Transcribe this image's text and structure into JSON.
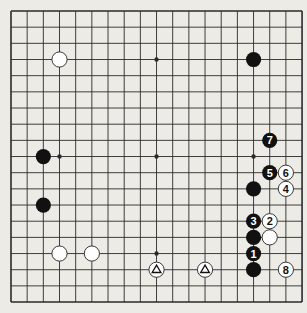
{
  "board": {
    "size": 19,
    "origin": [
      11,
      11
    ],
    "spacing": 16.17,
    "background": "#ecebe6",
    "line_color": "#2a2a2a",
    "black_color": "#111111",
    "white_color": "#ffffff"
  },
  "star_points": [
    {
      "col": 9,
      "row": 3
    },
    {
      "col": 3,
      "row": 9
    },
    {
      "col": 9,
      "row": 9
    },
    {
      "col": 15,
      "row": 9
    },
    {
      "col": 9,
      "row": 15
    }
  ],
  "stones": [
    {
      "color": "white",
      "col": 3,
      "row": 3,
      "label": "",
      "mark": ""
    },
    {
      "color": "black",
      "col": 15,
      "row": 3,
      "label": "",
      "mark": ""
    },
    {
      "color": "black",
      "col": 2,
      "row": 9,
      "label": "",
      "mark": ""
    },
    {
      "color": "black",
      "col": 2,
      "row": 12,
      "label": "",
      "mark": ""
    },
    {
      "color": "white",
      "col": 3,
      "row": 15,
      "label": "",
      "mark": ""
    },
    {
      "color": "white",
      "col": 5,
      "row": 15,
      "label": "",
      "mark": ""
    },
    {
      "color": "white",
      "col": 9,
      "row": 16,
      "label": "",
      "mark": "triangle"
    },
    {
      "color": "white",
      "col": 12,
      "row": 16,
      "label": "",
      "mark": "triangle"
    },
    {
      "color": "black",
      "col": 16,
      "row": 8,
      "label": "7",
      "mark": ""
    },
    {
      "color": "black",
      "col": 16,
      "row": 10,
      "label": "5",
      "mark": ""
    },
    {
      "color": "white",
      "col": 17,
      "row": 10,
      "label": "6",
      "mark": ""
    },
    {
      "color": "black",
      "col": 15,
      "row": 11,
      "label": "",
      "mark": ""
    },
    {
      "color": "white",
      "col": 17,
      "row": 11,
      "label": "4",
      "mark": ""
    },
    {
      "color": "black",
      "col": 15,
      "row": 13,
      "label": "3",
      "mark": ""
    },
    {
      "color": "white",
      "col": 16,
      "row": 13,
      "label": "2",
      "mark": ""
    },
    {
      "color": "black",
      "col": 15,
      "row": 14,
      "label": "",
      "mark": ""
    },
    {
      "color": "white",
      "col": 16,
      "row": 14,
      "label": "",
      "mark": ""
    },
    {
      "color": "black",
      "col": 15,
      "row": 15,
      "label": "1",
      "mark": ""
    },
    {
      "color": "black",
      "col": 15,
      "row": 16,
      "label": "",
      "mark": ""
    },
    {
      "color": "white",
      "col": 17,
      "row": 16,
      "label": "8",
      "mark": ""
    }
  ]
}
